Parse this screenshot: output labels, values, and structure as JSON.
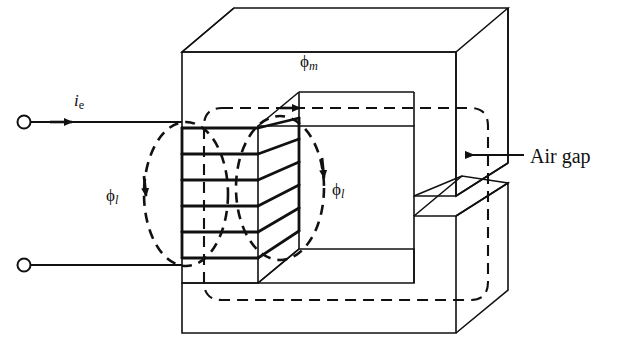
{
  "figure": {
    "type": "engineering-diagram",
    "background_color": "#ffffff",
    "line_color": "#111111"
  },
  "labels": {
    "main_flux": {
      "symbol": "ϕ",
      "subscript": "m",
      "text": "ϕm",
      "meaning": "main (mutual) magnetic flux"
    },
    "leakage_flux_left": {
      "symbol": "ϕ",
      "subscript": "l",
      "text": "ϕl",
      "meaning": "leakage flux"
    },
    "leakage_flux_right": {
      "symbol": "ϕ",
      "subscript": "l",
      "text": "ϕl",
      "meaning": "leakage flux"
    },
    "current": {
      "symbol": "i",
      "subscript": "e",
      "text": "ie",
      "meaning": "excitation current"
    },
    "air_gap": {
      "text": "Air gap",
      "meaning": "gap in the magnetic core"
    }
  },
  "components": {
    "core": {
      "name": "laminated iron core",
      "shape": "rectangular C-core with air gap",
      "rendering": "isometric 3D"
    },
    "coil": {
      "name": "excitation winding",
      "turns_drawn": 6,
      "limb": "left"
    },
    "terminals": [
      {
        "name": "top terminal",
        "marker": "open-circle"
      },
      {
        "name": "bottom terminal",
        "marker": "open-circle"
      }
    ],
    "air_gap": {
      "name": "air gap",
      "location": "right limb",
      "pointer": "arrow pointing left"
    }
  },
  "annotations": {
    "main_flux_arrow": "rightward arrow on top dashed path",
    "leakage_left_arrow": "downward arrow on left dashed ellipse",
    "leakage_right_arrow": "downward arrow on right dashed ellipse",
    "current_arrow": "rightward arrow on top lead wire"
  }
}
